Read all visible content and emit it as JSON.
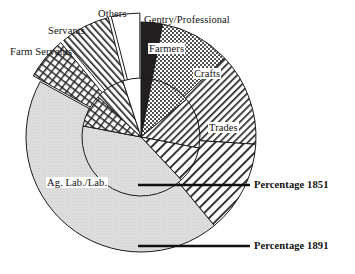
{
  "figure": {
    "center": {
      "x": 141,
      "y": 137
    },
    "inner_radius": 59,
    "outer_radius": 115,
    "background": "#ffffff",
    "outline_color": "#1a1a1a"
  },
  "annotations": [
    {
      "id": "inner-ring-callout",
      "label": "Percentage 1851",
      "label_x": 254,
      "label_y": 179,
      "line_x1": 138,
      "line_y1": 185,
      "line_x2": 250,
      "line_y2": 185
    },
    {
      "id": "outer-ring-callout",
      "label": "Percentage 1891",
      "label_x": 254,
      "label_y": 240,
      "line_x1": 138,
      "line_y1": 246,
      "line_x2": 250,
      "line_y2": 246
    }
  ],
  "labels": [
    {
      "id": "others",
      "text": "Others",
      "x": 98,
      "y": 8,
      "boxed": false
    },
    {
      "id": "gentry-professional",
      "text": "Gentry/Professional",
      "x": 144,
      "y": 14,
      "boxed": false
    },
    {
      "id": "servants",
      "text": "Servants",
      "x": 48,
      "y": 25,
      "boxed": false
    },
    {
      "id": "farm-servants",
      "text": "Farm Servants",
      "x": 10,
      "y": 46,
      "boxed": false
    },
    {
      "id": "farmers",
      "text": "Farmers",
      "x": 148,
      "y": 43,
      "boxed": true
    },
    {
      "id": "crafts",
      "text": "Crafts",
      "x": 193,
      "y": 68,
      "boxed": true
    },
    {
      "id": "trades",
      "text": "Trades",
      "x": 208,
      "y": 122,
      "boxed": true
    },
    {
      "id": "ag-lab",
      "text": "Ag. Lab./Lab.",
      "x": 46,
      "y": 177,
      "boxed": true
    }
  ],
  "chart_data": {
    "type": "pie",
    "subtitle": "",
    "xlabel": "",
    "ylabel": "",
    "legend_position": "callout-labels",
    "grid": false,
    "units": "percent",
    "note": "Nested double-ring pie. Inner ring = Percentage 1851, outer ring = Percentage 1891. Slices start at 12 o'clock and proceed clockwise. The three top-left slices (Others, Servants, Farm Servants) are exploded outward in the outer ring.",
    "categories": [
      "Gentry/Professional",
      "Farmers",
      "Crafts",
      "Trades",
      "Ag. Lab./Lab.",
      "Farm Servants",
      "Servants",
      "Others"
    ],
    "series": [
      {
        "name": "Percentage 1851",
        "ring": "inner",
        "values": [
          3,
          11,
          14,
          10,
          40,
          9,
          8,
          5
        ]
      },
      {
        "name": "Percentage 1891",
        "ring": "outer",
        "values": [
          3,
          10,
          13,
          13,
          44,
          6,
          7,
          4
        ]
      }
    ],
    "slice_styles": [
      {
        "category": "Gentry/Professional",
        "pattern": "solid-black",
        "fill": "#231f20"
      },
      {
        "category": "Farmers",
        "pattern": "dense-dotted-crosshatch",
        "fill": "#6e6e6e"
      },
      {
        "category": "Crafts",
        "pattern": "diagonal-hatch-45",
        "fill": "#ffffff"
      },
      {
        "category": "Trades",
        "pattern": "diagonal-hatch-45-wide",
        "fill": "#ffffff"
      },
      {
        "category": "Ag. Lab./Lab.",
        "pattern": "light-grey-stipple",
        "fill": "#d9d9d9"
      },
      {
        "category": "Farm Servants",
        "pattern": "grid-brick",
        "fill": "#ffffff"
      },
      {
        "category": "Servants",
        "pattern": "diagonal-hatch-135",
        "fill": "#ffffff"
      },
      {
        "category": "Others",
        "pattern": "blank-white",
        "fill": "#ffffff"
      }
    ]
  }
}
